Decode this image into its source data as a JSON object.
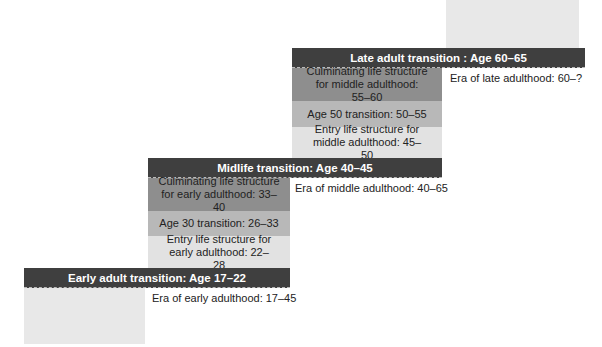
{
  "transitions": {
    "early": "Early adult transition: Age 17–22",
    "midlife": "Midlife transition: Age 40–45",
    "late": "Late adult transition : Age 60–65"
  },
  "early_adulthood": {
    "entry": "Entry life structure for early adulthood: 22–28",
    "age30": "Age 30 transition: 26–33",
    "culminating": "Culminating life structure for early adulthood: 33–40"
  },
  "middle_adulthood": {
    "entry": "Entry life structure for middle adulthood: 45–50",
    "age50": "Age 50 transition: 50–55",
    "culminating": "Culminating life structure for middle adulthood: 55–60"
  },
  "eras": {
    "early": "Era of early adulthood: 17–45",
    "middle": "Era of middle adulthood: 40–65",
    "late": "Era of late adulthood: 60–?"
  }
}
